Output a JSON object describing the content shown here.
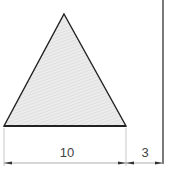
{
  "diagram": {
    "shape": "equilateral-triangle",
    "fill_color": "#e4e4e4",
    "stroke_color": "#222222",
    "dimensions": {
      "base_label": "10",
      "gap_label": "3"
    }
  }
}
